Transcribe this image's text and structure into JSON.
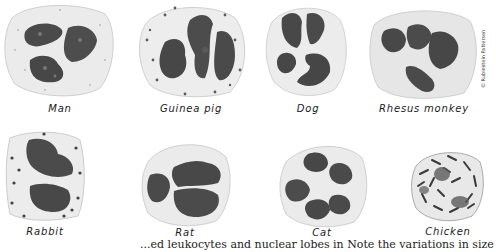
{
  "figure": {
    "cells": [
      {
        "id": "man",
        "label": "Man"
      },
      {
        "id": "guinea-pig",
        "label": "Guinea pig"
      },
      {
        "id": "dog",
        "label": "Dog"
      },
      {
        "id": "rhesus-monkey",
        "label": "Rhesus monkey"
      },
      {
        "id": "rabbit",
        "label": "Rabbit"
      },
      {
        "id": "rat",
        "label": "Rat"
      },
      {
        "id": "cat",
        "label": "Cat"
      },
      {
        "id": "chicken",
        "label": "Chicken"
      }
    ],
    "artist_credit": "© Rubinstein Pattersen",
    "caption_partial": "...ed leukocytes and nuclear lobes in  Note the variations in size and staining of the"
  },
  "colors": {
    "cytoplasm": "#e9e9e9",
    "cytoplasm_edge": "#c8c8c8",
    "nucleus": "#4a4a4a",
    "nucleus_light": "#7c7c7c",
    "granule": "#6e6e6e"
  }
}
